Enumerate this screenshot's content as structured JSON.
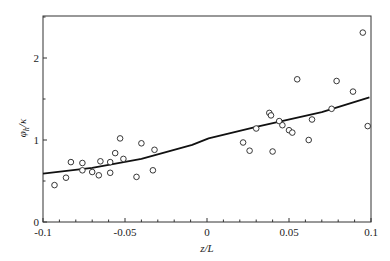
{
  "chart_data": {
    "type": "scatter",
    "title": "",
    "xlabel": "z/L",
    "ylabel": "φh/κ",
    "ylabel_main": "φ",
    "ylabel_sub": "h",
    "ylabel_tail": "/κ",
    "xlim": [
      -0.1,
      0.1
    ],
    "ylim": [
      0,
      2.5
    ],
    "grid": false,
    "legend": null,
    "xticks": [
      -0.1,
      -0.05,
      0,
      0.05,
      0.1
    ],
    "xtick_labels": [
      "-0.1",
      "-0.05",
      "0",
      "0.05",
      "0.1"
    ],
    "yticks": [
      0,
      1,
      2
    ],
    "ytick_labels": [
      "0",
      "1",
      "2"
    ],
    "series": [
      {
        "name": "observations",
        "type": "scatter",
        "marker": "open-circle",
        "x": [
          -0.093,
          -0.086,
          -0.083,
          -0.076,
          -0.076,
          -0.07,
          -0.066,
          -0.065,
          -0.059,
          -0.059,
          -0.056,
          -0.053,
          -0.051,
          -0.043,
          -0.04,
          -0.033,
          -0.032,
          0.022,
          0.026,
          0.03,
          0.038,
          0.04,
          0.039,
          0.044,
          0.046,
          0.05,
          0.052,
          0.055,
          0.062,
          0.064,
          0.076,
          0.079,
          0.089,
          0.095,
          0.098
        ],
        "y": [
          0.45,
          0.54,
          0.73,
          0.72,
          0.63,
          0.61,
          0.57,
          0.74,
          0.73,
          0.6,
          0.84,
          1.02,
          0.77,
          0.55,
          0.96,
          0.63,
          0.88,
          0.97,
          0.87,
          1.14,
          1.33,
          0.86,
          1.3,
          1.23,
          1.18,
          1.12,
          1.09,
          1.74,
          1.0,
          1.25,
          1.38,
          1.72,
          1.59,
          2.31,
          1.17
        ]
      },
      {
        "name": "fit",
        "type": "line",
        "x": [
          -0.1,
          -0.07,
          -0.04,
          -0.009,
          0.001,
          0.03,
          0.07,
          0.099
        ],
        "y": [
          0.59,
          0.66,
          0.77,
          0.94,
          1.02,
          1.16,
          1.34,
          1.52
        ]
      }
    ]
  }
}
